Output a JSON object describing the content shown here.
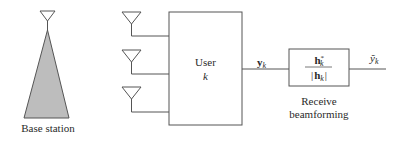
{
  "diagram": {
    "type": "block-diagram",
    "base_station": {
      "label": "Base station",
      "fill": "#bdbdbd"
    },
    "user_block": {
      "line1": "User",
      "line2": "k",
      "antenna_count": 3
    },
    "signal_in": {
      "symbol": "y",
      "subscript": "k"
    },
    "beamformer": {
      "numerator_symbol": "h",
      "numerator_superscript": "*",
      "numerator_subscript": "k",
      "denominator_symbol": "h",
      "denominator_subscript": "k",
      "label_line1": "Receive",
      "label_line2": "beamforming"
    },
    "signal_out": {
      "symbol": "ỹ",
      "subscript": "k"
    },
    "colors": {
      "line": "#555555",
      "text": "#2a2a2a",
      "fill": "#bdbdbd"
    }
  }
}
